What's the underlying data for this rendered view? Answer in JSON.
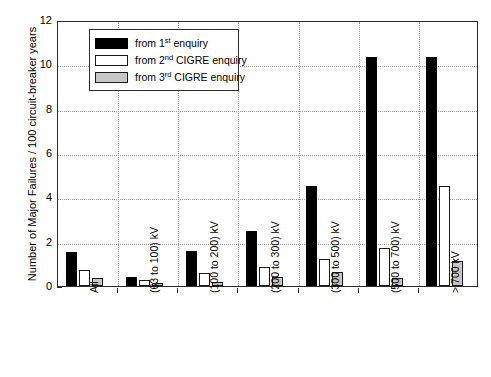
{
  "chart_data": {
    "type": "bar",
    "title": "",
    "xlabel": "",
    "ylabel": "Number of Major Failures / 100 circuit-breaker years",
    "ylim": [
      0,
      12
    ],
    "yticks": [
      0,
      2,
      4,
      6,
      8,
      10,
      12
    ],
    "grid": true,
    "legend_position": "top-left-inside",
    "categories": [
      "All",
      "(63 to 100) kV",
      "(100 to 200) kV",
      "(200 to 300) kV",
      "(300 to 500) kV",
      "(500 to 700) kV",
      "> 700 kV"
    ],
    "series": [
      {
        "name": "from 1st enquiry",
        "color": "#000000",
        "values": [
          1.55,
          0.4,
          1.6,
          2.5,
          4.5,
          10.35,
          10.35
        ]
      },
      {
        "name": "from 2nd CIGRE enquiry",
        "color": "#ffffff",
        "values": [
          0.7,
          0.25,
          0.6,
          0.85,
          1.2,
          1.7,
          4.5
        ]
      },
      {
        "name": "from 3rd CIGRE enquiry",
        "color": "#c6c6c6",
        "values": [
          0.35,
          0.12,
          0.2,
          0.4,
          0.65,
          0.35,
          1.15
        ]
      }
    ]
  },
  "legend": {
    "items": [
      {
        "prefix": "from 1",
        "sup": "st",
        "suffix": " enquiry"
      },
      {
        "prefix": "from 2",
        "sup": "nd",
        "suffix": " CIGRE enquiry"
      },
      {
        "prefix": "from 3",
        "sup": "rd",
        "suffix": " CIGRE enquiry"
      }
    ]
  },
  "colors": {
    "axis": "#2b2b2b",
    "grid": "#9a9a9a",
    "series1": "#000000",
    "series2": "#ffffff",
    "series3": "#c6c6c6",
    "background": "#ffffff"
  }
}
